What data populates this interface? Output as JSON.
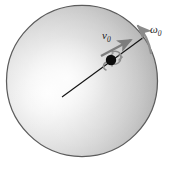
{
  "figure": {
    "kind": "physics-diagram",
    "background_color": "#ffffff",
    "sphere": {
      "name": "bowling-ball",
      "center_x": 82,
      "center_y": 81,
      "radius": 76,
      "fill_light": "#fcfcfc",
      "fill_mid": "#d4d4d4",
      "fill_dark": "#a8a8a8",
      "outline_color": "#4a4a4a",
      "highlight_x": 62,
      "highlight_y": 96
    },
    "radius_line": {
      "name": "radius-line",
      "x1": 63,
      "y1": 96,
      "x2": 143,
      "y2": 38,
      "color": "#101010"
    },
    "contact_point": {
      "name": "contact-point-dot",
      "cx": 111,
      "cy": 60,
      "r": 5.2,
      "color": "#0d0d0d"
    },
    "spin_marker": {
      "name": "spin-curl-marker",
      "color": "#7a7a7a"
    },
    "velocity_arrow": {
      "name": "velocity-arrow",
      "label": "v",
      "subscript": "0",
      "label_x": 105,
      "label_y": 38,
      "x1": 102,
      "y1": 56,
      "x2": 133,
      "y2": 39,
      "color": "#7d7d7d"
    },
    "angular_velocity_arrow": {
      "name": "angular-velocity-arrow",
      "label": "ω",
      "subscript": "0",
      "label_x": 152,
      "label_y": 32,
      "color": "#8a8a8a"
    },
    "caption": ""
  }
}
